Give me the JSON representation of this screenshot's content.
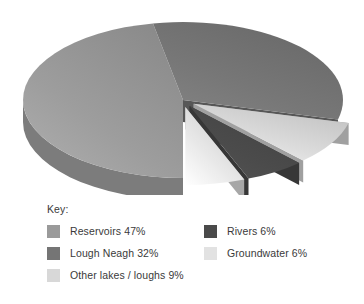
{
  "legend": {
    "title": "Key:",
    "columns": [
      {
        "items": [
          {
            "label": "Reservoirs 47%",
            "color": "#9a9a9a",
            "swatch_name": "swatch-reservoirs"
          },
          {
            "label": "Lough Neagh 32%",
            "color": "#757575",
            "swatch_name": "swatch-lough-neagh"
          },
          {
            "label": "Other lakes / loughs 9%",
            "color": "#d8d8d8",
            "swatch_name": "swatch-other-lakes"
          }
        ]
      },
      {
        "items": [
          {
            "label": "Rivers 6%",
            "color": "#4a4a4a",
            "swatch_name": "swatch-rivers"
          },
          {
            "label": "Groundwater 6%",
            "color": "#e2e2e2",
            "swatch_name": "swatch-groundwater"
          }
        ]
      }
    ]
  },
  "chart_data": {
    "type": "pie",
    "title": "",
    "subtitle": "",
    "xlabel": "",
    "ylabel": "",
    "three_d": true,
    "exploded": true,
    "grid": false,
    "legend_position": "bottom",
    "labels": [
      "Reservoirs",
      "Lough Neagh",
      "Other lakes / loughs",
      "Rivers",
      "Groundwater"
    ],
    "values": [
      47,
      32,
      9,
      6,
      6
    ],
    "units": "%",
    "total": 100,
    "slices": [
      {
        "label": "Reservoirs",
        "value": 47,
        "display": "47%",
        "color": "#9a9a9a",
        "side_color": "#7c7c7c",
        "exploded": false
      },
      {
        "label": "Lough Neagh",
        "value": 32,
        "display": "32%",
        "color": "#757575",
        "side_color": "#646464",
        "exploded": false
      },
      {
        "label": "Other lakes / loughs",
        "value": 9,
        "display": "9%",
        "color": "#d8d8d8",
        "side_color": "#b4b4b4",
        "exploded": true
      },
      {
        "label": "Rivers",
        "value": 6,
        "display": "6%",
        "color": "#4a4a4a",
        "side_color": "#3d3d3d",
        "exploded": true
      },
      {
        "label": "Groundwater",
        "value": 6,
        "display": "6%",
        "color": "#e2e2e2",
        "side_color": "#bdbdbd",
        "exploded": true
      }
    ]
  }
}
